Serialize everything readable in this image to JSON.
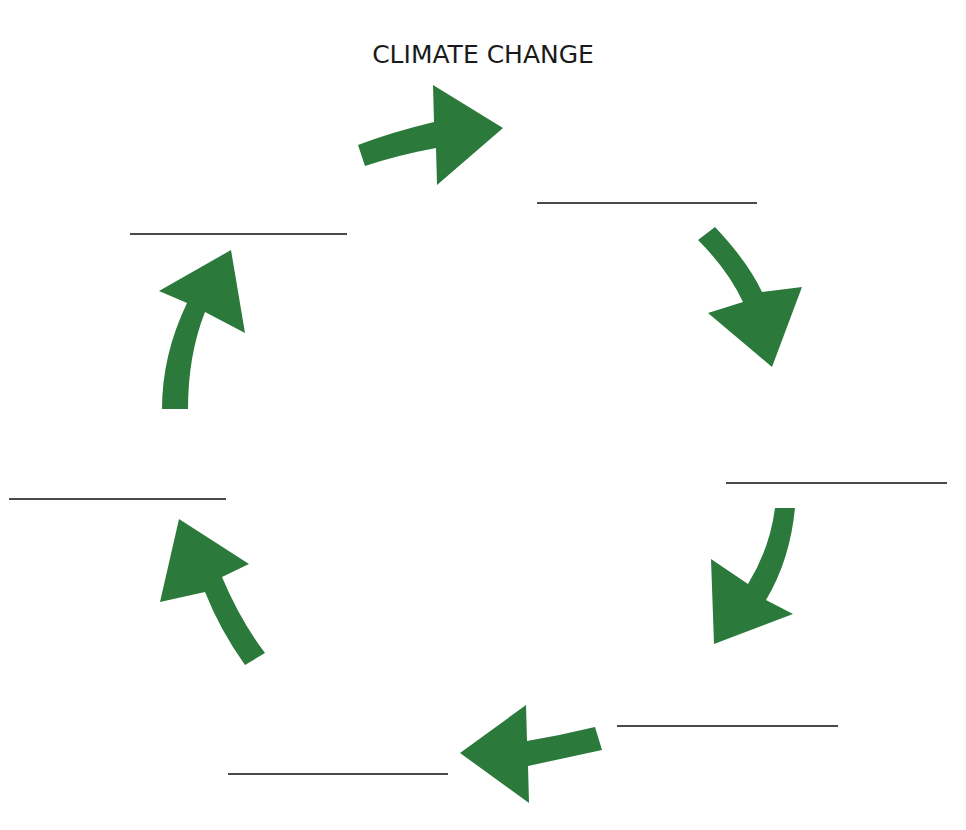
{
  "diagram": {
    "title": "CLIMATE CHANGE",
    "type": "cycle",
    "arrow_color": "#2b7a3b",
    "line_color": "#4a4a4a",
    "nodes": [
      {
        "id": "blank-1",
        "label": "",
        "position": "top-right"
      },
      {
        "id": "blank-2",
        "label": "",
        "position": "right"
      },
      {
        "id": "blank-3",
        "label": "",
        "position": "bottom-right"
      },
      {
        "id": "blank-4",
        "label": "",
        "position": "bottom-left"
      },
      {
        "id": "blank-5",
        "label": "",
        "position": "left"
      },
      {
        "id": "blank-6",
        "label": "",
        "position": "top-left"
      }
    ],
    "edges": [
      {
        "from": "title",
        "to": "blank-1",
        "direction": "clockwise"
      },
      {
        "from": "blank-1",
        "to": "blank-2",
        "direction": "clockwise"
      },
      {
        "from": "blank-2",
        "to": "blank-3",
        "direction": "clockwise"
      },
      {
        "from": "blank-3",
        "to": "blank-4",
        "direction": "clockwise"
      },
      {
        "from": "blank-4",
        "to": "blank-5",
        "direction": "clockwise"
      },
      {
        "from": "blank-5",
        "to": "blank-6",
        "direction": "clockwise"
      },
      {
        "from": "blank-6",
        "to": "title",
        "direction": "clockwise"
      }
    ]
  }
}
